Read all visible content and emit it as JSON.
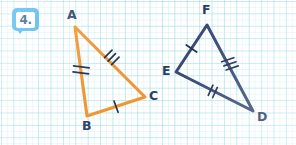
{
  "page": {
    "width": 296,
    "height": 145,
    "background": "#ffffff",
    "grid_color": "#a8dee6",
    "grid_spacing_px": 12.4
  },
  "badge": {
    "name": "problem-number-badge",
    "text": "4.",
    "bubble_color": "#4db7ec",
    "text_color": "#2d5f86"
  },
  "colors": {
    "orange_stroke": "#f0952f",
    "blue_stroke": "#3a4a77",
    "label_text": "#2b3d66",
    "tick_dark": "#22304f"
  },
  "figures": [
    {
      "id": "orange-triangle",
      "name": "triangle-ABC",
      "stroke_color": "#f0952f",
      "stroke_width": 3.1,
      "vertices": [
        {
          "label": "A",
          "x": 75,
          "y": 27,
          "label_x": 67,
          "label_y": 10
        },
        {
          "label": "B",
          "x": 87,
          "y": 116,
          "label_x": 82,
          "label_y": 122
        },
        {
          "label": "C",
          "x": 145,
          "y": 97,
          "label_x": 148,
          "label_y": 91
        }
      ],
      "sides": [
        {
          "name": "side-AB",
          "from": "A",
          "to": "B",
          "ticks": 2,
          "tick_color": "#22304f"
        },
        {
          "name": "side-AC",
          "from": "A",
          "to": "C",
          "ticks": 3,
          "tick_color": "#22304f"
        },
        {
          "name": "side-BC",
          "from": "B",
          "to": "C",
          "ticks": 1,
          "tick_color": "#22304f"
        }
      ]
    },
    {
      "id": "blue-triangle",
      "name": "triangle-EFD",
      "stroke_color": "#3a4a77",
      "stroke_width": 3.0,
      "vertices": [
        {
          "label": "F",
          "x": 207,
          "y": 25,
          "label_x": 202,
          "label_y": 5
        },
        {
          "label": "E",
          "x": 176,
          "y": 72,
          "label_x": 162,
          "label_y": 66
        },
        {
          "label": "D",
          "x": 253,
          "y": 111,
          "label_x": 257,
          "label_y": 114
        }
      ],
      "sides": [
        {
          "name": "side-EF",
          "from": "E",
          "to": "F",
          "ticks": 1,
          "tick_color": "#22304f"
        },
        {
          "name": "side-FD",
          "from": "F",
          "to": "D",
          "ticks": 3,
          "tick_color": "#22304f"
        },
        {
          "name": "side-ED",
          "from": "E",
          "to": "D",
          "ticks": 2,
          "tick_color": "#22304f"
        }
      ]
    }
  ]
}
